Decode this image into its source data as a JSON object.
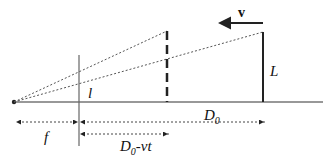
{
  "diagram": {
    "labels": {
      "velocity": "v",
      "object_height": "L",
      "lens_image": "l",
      "distance_initial_main": "D",
      "distance_initial_sub": "0",
      "distance_moving_main": "D",
      "distance_moving_sub": "0",
      "distance_moving_suffix": "-vt",
      "focal": "f"
    },
    "colors": {
      "stroke": "#222222",
      "dotted": "#555555"
    }
  }
}
